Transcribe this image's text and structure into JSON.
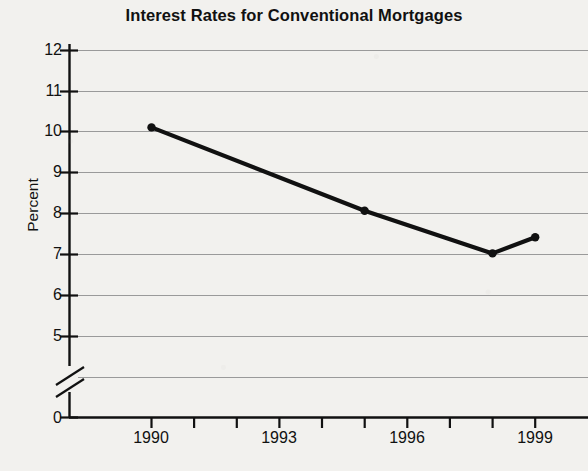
{
  "chart_data": {
    "type": "line",
    "title": "Interest Rates for Conventional Mortgages",
    "xlabel": "",
    "ylabel": "Percent",
    "x": [
      1990,
      1995,
      1998,
      1999
    ],
    "values": [
      10.1,
      8.05,
      7.0,
      7.4
    ],
    "series": [
      {
        "name": "Conventional mortgage interest rate",
        "values": [
          10.1,
          8.05,
          7.0,
          7.4
        ]
      }
    ],
    "xlim": [
      1989.5,
      1999.6
    ],
    "ylim": [
      0,
      12
    ],
    "y_ticks": [
      0,
      5,
      6,
      7,
      8,
      9,
      10,
      11,
      12
    ],
    "y_tick_labels": [
      "0",
      "5",
      "6",
      "7",
      "8",
      "9",
      "10",
      "11",
      "12"
    ],
    "x_ticks": [
      1990,
      1991,
      1992,
      1993,
      1994,
      1995,
      1996,
      1997,
      1998,
      1999
    ],
    "x_tick_labels": [
      "1990",
      "",
      "",
      "1993",
      "",
      "",
      "1996",
      "",
      "",
      "1999"
    ],
    "x_labeled_ticks": [
      "1990",
      "1993",
      "1996",
      "1999"
    ],
    "grid": "horizontal",
    "axis_break": true,
    "axis_break_between": [
      0,
      5
    ],
    "legend": "none",
    "marker": "circle",
    "line_color": "#111111",
    "grid_color": "#9a9a9a",
    "background_color": "#f2f1ee"
  }
}
